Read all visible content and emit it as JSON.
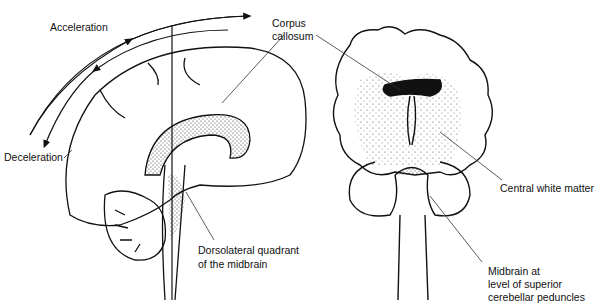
{
  "figure": {
    "type": "anatomical-diagram",
    "views": [
      "sagittal brain view with motion arrows",
      "coronal brain section"
    ],
    "labels": {
      "acceleration": "Acceleration",
      "deceleration": "Deceleration",
      "corpus_callosum_1": "Corpus",
      "corpus_callosum_2": "callosum",
      "dorsolateral_1": "Dorsolateral quadrant",
      "dorsolateral_2": "of the midbrain",
      "central_white_matter": "Central white matter",
      "midbrain_1": "Midbrain at",
      "midbrain_2": "level of superior",
      "midbrain_3": "cerebellar peduncles"
    },
    "colors": {
      "ink": "#111111",
      "background": "#ffffff"
    }
  }
}
